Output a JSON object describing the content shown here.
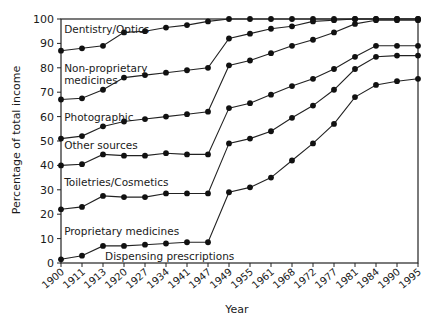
{
  "chart_data": {
    "type": "line",
    "title": "",
    "xlabel": "Year",
    "ylabel": "Percentage of total income",
    "ylim": [
      0,
      100
    ],
    "yticks": [
      0,
      10,
      20,
      30,
      40,
      50,
      60,
      70,
      80,
      90,
      100
    ],
    "grid": false,
    "legend_position": "inline labels",
    "x": [
      "1900",
      "1911",
      "1913",
      "1920",
      "1927",
      "1934",
      "1941",
      "1947",
      "1949",
      "1955",
      "1961",
      "1968",
      "1972",
      "1977",
      "1981",
      "1984",
      "1990",
      "1995"
    ],
    "series": [
      {
        "name": "Dispensing prescriptions",
        "values": [
          1.5,
          3,
          7,
          7,
          7.5,
          8,
          8.5,
          8.5,
          29,
          31,
          35,
          42,
          49,
          57,
          68,
          73,
          74.5,
          75.5
        ]
      },
      {
        "name": "Proprietary medicines",
        "values": [
          22,
          23,
          27.5,
          27,
          27,
          28.5,
          28.5,
          28.5,
          49,
          51,
          54,
          59.5,
          64.5,
          71,
          79.5,
          84.5,
          85,
          85
        ]
      },
      {
        "name": "Toiletries/Cosmetics",
        "values": [
          40,
          40.5,
          44.5,
          44,
          44,
          45,
          44.5,
          44.5,
          63.5,
          65.5,
          69,
          72.5,
          75.5,
          79.5,
          84.5,
          89,
          89,
          89
        ]
      },
      {
        "name": "Other sources",
        "values": [
          51,
          52,
          56,
          58,
          59,
          60,
          61,
          62,
          81,
          83,
          86,
          89,
          91.5,
          94.5,
          98,
          99.5,
          99.5,
          99.5
        ]
      },
      {
        "name": "Photographic",
        "values": [
          51,
          52,
          56,
          58,
          59,
          60,
          61,
          62,
          81,
          83,
          86,
          89,
          91.5,
          94.5,
          98,
          99.5,
          99.5,
          99.5
        ]
      },
      {
        "name": "Non-proprietary medicines",
        "values": [
          67,
          67.5,
          71,
          76,
          77,
          78,
          79,
          80,
          92,
          94,
          96,
          97,
          99,
          99.5,
          100,
          100,
          100,
          100
        ]
      },
      {
        "name": "Dentistry/Optics",
        "values": [
          87,
          88,
          89,
          94.5,
          95,
          96.5,
          97.5,
          99,
          100,
          100,
          100,
          100,
          100,
          100,
          100,
          100,
          100,
          100
        ]
      }
    ],
    "annotations": [
      {
        "text": "Dentistry/Optics",
        "x_index": 0.15,
        "y": 96
      },
      {
        "text": "Non-proprietary",
        "x_index": 0.15,
        "y": 80
      },
      {
        "text": "medicines",
        "x_index": 0.15,
        "y": 75
      },
      {
        "text": "Photographic",
        "x_index": 0.15,
        "y": 60
      },
      {
        "text": "Other sources",
        "x_index": 0.15,
        "y": 48.5
      },
      {
        "text": "Toiletries/Cosmetics",
        "x_index": 0.15,
        "y": 33
      },
      {
        "text": "Proprietary medicines",
        "x_index": 0.15,
        "y": 13
      },
      {
        "text": "Dispensing prescriptions",
        "x_index": 2.1,
        "y": 3
      }
    ]
  }
}
